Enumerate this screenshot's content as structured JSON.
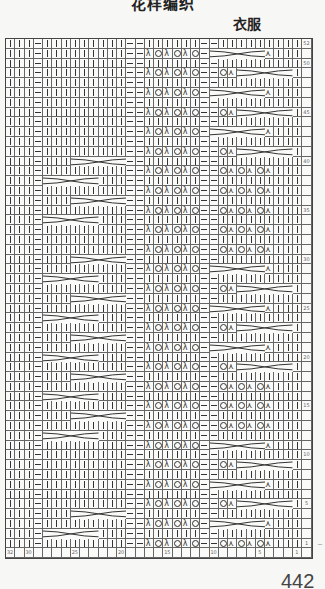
{
  "header": {
    "title": "花样编织",
    "subtitle": "衣服"
  },
  "page_number": "442",
  "chart_data": {
    "type": "table",
    "title": "衣服",
    "columns": 32,
    "rows": 52,
    "column_labels": {
      "32": "32",
      "30": "30",
      "25": "25",
      "20": "20",
      "15": "15",
      "10": "10",
      "5": "5",
      "1": "1"
    },
    "row_labels": {
      "52": "52",
      "50": "50",
      "45": "45",
      "40": "40",
      "35": "35",
      "30": "30",
      "25": "25",
      "20": "20",
      "15": "15",
      "10": "10",
      "5": "5",
      "1": "1"
    },
    "legend": {
      "k": "knit (|)",
      "p": "purl (—)",
      "o": "yarn over (O)",
      "l": "left-leaning decrease (λ)",
      "r": "right-leaning decrease (⋏)",
      "cable": "3-over-3 cable cross"
    },
    "base_even_row": "kkkpkkkkkkkkkppkkkkkkpkkkkkkpkkk",
    "base_odd_row": "kkkpkkkkkkkkkpplolololpkkkkkkplororork",
    "lace_left_odd": [
      "l",
      "o",
      "l",
      "o",
      "l",
      "o"
    ],
    "lace_right_odd": [
      "o",
      "r",
      "o",
      "r",
      "o",
      "r"
    ],
    "left_cables": [
      {
        "row": 40,
        "start_col": 25
      },
      {
        "row": 38,
        "start_col": 28
      },
      {
        "row": 36,
        "start_col": 25
      },
      {
        "row": 34,
        "start_col": 28
      },
      {
        "row": 30,
        "start_col": 25
      },
      {
        "row": 28,
        "start_col": 28
      },
      {
        "row": 26,
        "start_col": 25
      },
      {
        "row": 24,
        "start_col": 28
      },
      {
        "row": 22,
        "start_col": 25
      },
      {
        "row": 20,
        "start_col": 28
      },
      {
        "row": 18,
        "start_col": 25
      },
      {
        "row": 16,
        "start_col": 28
      },
      {
        "row": 14,
        "start_col": 25
      },
      {
        "row": 12,
        "start_col": 28
      },
      {
        "row": 4,
        "start_col": 25
      },
      {
        "row": 2,
        "start_col": 28
      }
    ],
    "right_cables": [
      {
        "row": 51,
        "start_col": 10
      },
      {
        "row": 49,
        "start_col": 7
      },
      {
        "row": 47,
        "start_col": 10
      },
      {
        "row": 45,
        "start_col": 7
      },
      {
        "row": 43,
        "start_col": 10
      },
      {
        "row": 41,
        "start_col": 7
      },
      {
        "row": 29,
        "start_col": 10
      },
      {
        "row": 27,
        "start_col": 7
      },
      {
        "row": 25,
        "start_col": 10
      },
      {
        "row": 23,
        "start_col": 7
      },
      {
        "row": 21,
        "start_col": 10
      },
      {
        "row": 19,
        "start_col": 7
      },
      {
        "row": 11,
        "start_col": 10
      },
      {
        "row": 9,
        "start_col": 7
      },
      {
        "row": 7,
        "start_col": 10
      },
      {
        "row": 5,
        "start_col": 7
      },
      {
        "row": 3,
        "start_col": 10
      }
    ]
  }
}
